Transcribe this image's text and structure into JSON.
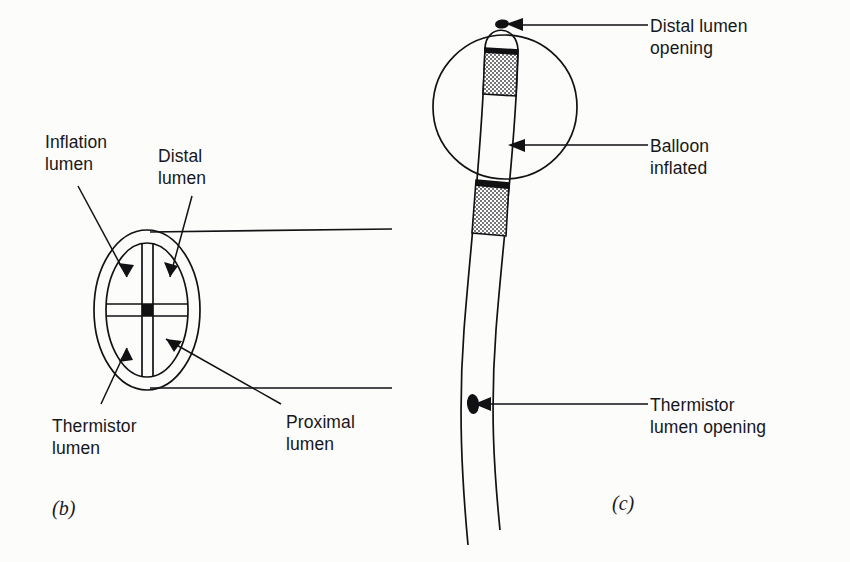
{
  "figure": {
    "background_color": "#fcfcfa",
    "ink_color": "#111114"
  },
  "panel_b": {
    "tag": "(b)",
    "title": "Catheter cross-section",
    "labels": {
      "inflation_lumen": "Inflation\nlumen",
      "inflation_lumen_line1": "Inflation",
      "inflation_lumen_line2": "lumen",
      "distal_lumen_line1": "Distal",
      "distal_lumen_line2": "lumen",
      "thermistor_lumen_line1": "Thermistor",
      "thermistor_lumen_line2": "lumen",
      "proximal_lumen_line1": "Proximal",
      "proximal_lumen_line2": "lumen"
    },
    "lumen_count": 4,
    "lumen_names": [
      "Inflation lumen",
      "Distal lumen",
      "Thermistor lumen",
      "Proximal lumen"
    ]
  },
  "panel_c": {
    "tag": "(c)",
    "title": "Catheter tip with balloon inflated",
    "labels": {
      "distal_lumen_opening_line1": "Distal lumen",
      "distal_lumen_opening_line2": "opening",
      "balloon_inflated_line1": "Balloon",
      "balloon_inflated_line2": "inflated",
      "thermistor_lumen_opening_line1": "Thermistor",
      "thermistor_lumen_opening_line2": "lumen opening"
    },
    "features": [
      "Distal lumen opening",
      "Balloon inflated",
      "Thermistor lumen opening"
    ]
  }
}
